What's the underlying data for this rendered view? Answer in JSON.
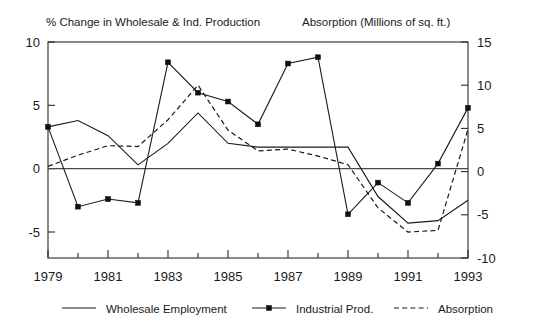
{
  "chart_data": {
    "type": "line",
    "title": "",
    "left_axis_title": "% Change in Wholesale & Ind. Production",
    "right_axis_title": "Absorption (Millions of sq. ft.)",
    "xlabel": "",
    "ylabel": "% Change in Wholesale & Ind. Production",
    "y2label": "Absorption (Millions of sq. ft.)",
    "xlim": [
      1979,
      1993
    ],
    "ylim": [
      -7.5,
      10
    ],
    "y2lim": [
      -10,
      15
    ],
    "ylim_left_display": [
      -5,
      10
    ],
    "grid": false,
    "legend_position": "bottom",
    "x": [
      1979,
      1980,
      1981,
      1982,
      1983,
      1984,
      1985,
      1986,
      1987,
      1988,
      1989,
      1990,
      1991,
      1992,
      1993
    ],
    "xticks": [
      1979,
      1981,
      1983,
      1985,
      1987,
      1989,
      1991,
      1993
    ],
    "xtick_labels": [
      "1979",
      "1981",
      "1983",
      "1985",
      "1987",
      "1989",
      "1991",
      "1993"
    ],
    "xticks_minor": [
      1980,
      1982,
      1984,
      1986,
      1988,
      1990,
      1992
    ],
    "yticks_left": [
      10,
      5,
      0,
      -5
    ],
    "ytick_labels_left": [
      "10",
      "5",
      "0",
      "-5"
    ],
    "yticks_right": [
      15,
      10,
      5,
      0,
      -5,
      -10
    ],
    "ytick_labels_right": [
      "15",
      "10",
      "5",
      "0",
      "-5",
      "-10"
    ],
    "series": [
      {
        "name": "Wholesale Employment",
        "axis": "left",
        "style": "solid",
        "marker": "none",
        "values": [
          3.3,
          3.8,
          2.6,
          0.3,
          2.0,
          4.4,
          2.0,
          1.7,
          1.7,
          1.7,
          1.7,
          -2.2,
          -4.3,
          -4.1,
          -2.5
        ]
      },
      {
        "name": "Industrial Prod.",
        "axis": "left",
        "style": "solid",
        "marker": "filled-square",
        "values": [
          3.3,
          -3.0,
          -2.4,
          -2.7,
          8.4,
          6.0,
          5.3,
          3.5,
          8.3,
          8.8,
          -3.6,
          -1.1,
          -2.7,
          0.4,
          4.8
        ]
      },
      {
        "name": "Absorption",
        "axis": "right",
        "style": "dashed",
        "marker": "none",
        "values": [
          0.6,
          1.9,
          3.0,
          2.9,
          6.0,
          10.0,
          4.8,
          2.4,
          2.6,
          1.8,
          0.8,
          -4.2,
          -7.0,
          -6.8,
          4.9
        ]
      }
    ]
  },
  "legend": {
    "items": [
      {
        "label": "Wholesale Employment",
        "style": "solid",
        "marker": "none"
      },
      {
        "label": "Industrial Prod.",
        "style": "solid",
        "marker": "filled-square"
      },
      {
        "label": "Absorption",
        "style": "dashed",
        "marker": "none"
      }
    ]
  }
}
